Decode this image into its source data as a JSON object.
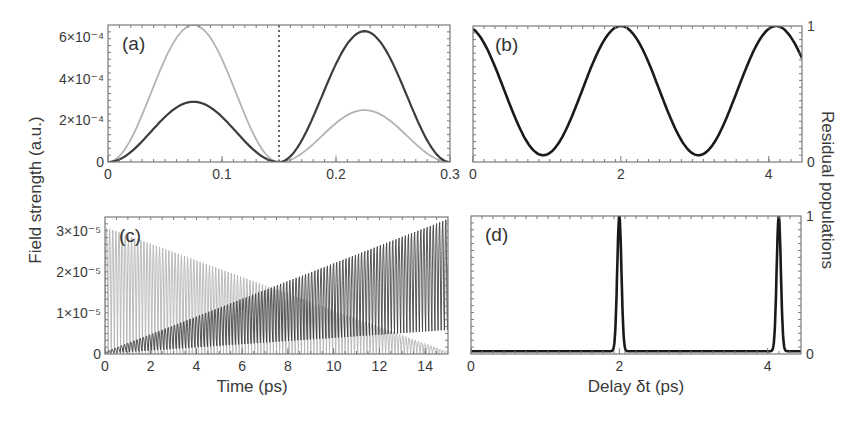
{
  "figure": {
    "shared_ylabel_left": "Field strength (a.u.)",
    "shared_ylabel_right": "Residual populations",
    "xlabel_left": "Time (ps)",
    "xlabel_right": "Delay δt (ps)"
  },
  "colors": {
    "dark_curve": "#3c3c3c",
    "light_curve": "#b4b4b4",
    "black_curve": "#1a1a1a",
    "frame": "#7a7a7a"
  },
  "chart_data": [
    {
      "panel": "(a)",
      "type": "line",
      "title": "",
      "xlabel": "",
      "ylabel": "Field strength (a.u.)",
      "xlim": [
        0,
        0.3
      ],
      "ylim": [
        0,
        0.00066
      ],
      "xticks": [
        0,
        0.1,
        0.2,
        0.3
      ],
      "xtick_labels": [
        "0",
        "0.1",
        "0.2",
        "0.3"
      ],
      "yticks": [
        0,
        0.0002,
        0.0004,
        0.0006
      ],
      "ytick_labels": [
        "0",
        "2×10⁻⁴",
        "4×10⁻⁴",
        "6×10⁻⁴"
      ],
      "annotations": [
        {
          "type": "vertical_dotted_line",
          "x": 0.15
        }
      ],
      "series": [
        {
          "name": "light pulse envelope",
          "color": "light",
          "segments": [
            {
              "x0": 0.0,
              "x1": 0.15,
              "peak_x": 0.077,
              "peak": 0.00066
            },
            {
              "x0": 0.15,
              "x1": 0.3,
              "peak_x": 0.225,
              "peak": 0.00025
            }
          ]
        },
        {
          "name": "dark pulse envelope",
          "color": "dark",
          "segments": [
            {
              "x0": 0.0,
              "x1": 0.15,
              "peak_x": 0.077,
              "peak": 0.00029
            },
            {
              "x0": 0.15,
              "x1": 0.3,
              "peak_x": 0.225,
              "peak": 0.00063
            }
          ]
        }
      ]
    },
    {
      "panel": "(b)",
      "type": "line",
      "xlabel": "",
      "ylabel": "Residual populations",
      "xlim": [
        0,
        4.45
      ],
      "ylim": [
        0,
        1
      ],
      "xticks": [
        0,
        2,
        4
      ],
      "xtick_labels": [
        "0",
        "2",
        "4"
      ],
      "yticks": [
        0,
        1
      ],
      "ytick_labels": [
        "0",
        "1"
      ],
      "series": [
        {
          "name": "residual population",
          "color": "black",
          "x": [
            0,
            0.5,
            0.95,
            1.5,
            2.0,
            2.5,
            3.05,
            3.6,
            4.1,
            4.45
          ],
          "y": [
            0.93,
            0.5,
            0.05,
            0.5,
            1.0,
            0.5,
            0.05,
            0.5,
            1.0,
            0.8
          ]
        }
      ]
    },
    {
      "panel": "(c)",
      "type": "line",
      "xlabel": "Time (ps)",
      "ylabel": "Field strength (a.u.)",
      "xlim": [
        0,
        15
      ],
      "ylim": [
        0,
        3.35e-05
      ],
      "xticks": [
        0,
        2,
        4,
        6,
        8,
        10,
        12,
        14
      ],
      "xtick_labels": [
        "0",
        "2",
        "4",
        "6",
        "8",
        "10",
        "12",
        "14"
      ],
      "yticks": [
        0,
        1e-05,
        2e-05,
        3e-05
      ],
      "ytick_labels": [
        "0",
        "1×10⁻⁵",
        "2×10⁻⁵",
        "3×10⁻⁵"
      ],
      "series": [
        {
          "name": "decaying oscillating field",
          "color": "light",
          "envelope_start": 3.1e-05,
          "envelope_end": 5e-07,
          "oscillations": 110
        },
        {
          "name": "growing oscillating field",
          "color": "dark",
          "envelope_start": 5e-07,
          "envelope_end": 3.35e-05,
          "oscillations": 110
        }
      ]
    },
    {
      "panel": "(d)",
      "type": "line",
      "xlabel": "Delay δt (ps)",
      "ylabel": "Residual populations",
      "xlim": [
        0,
        4.45
      ],
      "ylim": [
        0,
        1
      ],
      "xticks": [
        0,
        2,
        4
      ],
      "xtick_labels": [
        "0",
        "2",
        "4"
      ],
      "yticks": [
        0,
        1
      ],
      "ytick_labels": [
        "0",
        "1"
      ],
      "series": [
        {
          "name": "residual population",
          "color": "black",
          "baseline": 0.02,
          "peaks": [
            {
              "x": 2.0,
              "height": 1.0,
              "width": 0.04
            },
            {
              "x": 4.15,
              "height": 1.0,
              "width": 0.04
            }
          ]
        }
      ]
    }
  ],
  "panels_layout": [
    {
      "id": "a",
      "x": 108,
      "y": 25,
      "w": 342,
      "h": 137,
      "yaxis": "left"
    },
    {
      "id": "b",
      "x": 473,
      "y": 26,
      "w": 329,
      "h": 136,
      "yaxis": "right"
    },
    {
      "id": "c",
      "x": 105,
      "y": 217,
      "w": 343,
      "h": 137,
      "yaxis": "left"
    },
    {
      "id": "d",
      "x": 471,
      "y": 216,
      "w": 330,
      "h": 138,
      "yaxis": "right"
    }
  ]
}
